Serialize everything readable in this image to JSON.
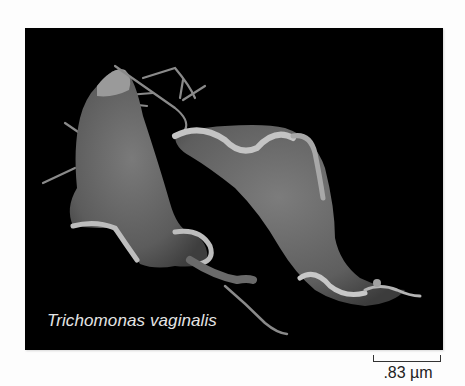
{
  "figure": {
    "type": "scanning electron micrograph",
    "caption": "Trichomonas vaginalis",
    "background_color": "#000000",
    "caption_color": "#e4e4e4"
  },
  "scale_bar": {
    "label": ".83 µm"
  }
}
